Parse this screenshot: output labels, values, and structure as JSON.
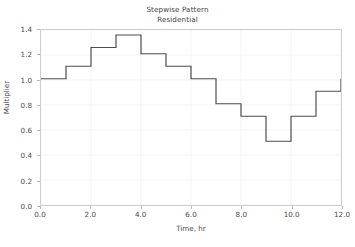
{
  "chart_data": {
    "type": "line",
    "subtype": "step-post",
    "title": "Stepwise Pattern",
    "subtitle": "Residential",
    "xlabel": "Time, hr",
    "ylabel": "Multiplier",
    "xlim": [
      0.0,
      12.0
    ],
    "ylim": [
      0.0,
      1.4
    ],
    "xticks": [
      "0.0",
      "2.0",
      "4.0",
      "6.0",
      "8.0",
      "10.0",
      "12.0"
    ],
    "xtick_values": [
      0.0,
      2.0,
      4.0,
      6.0,
      8.0,
      10.0,
      12.0
    ],
    "yticks": [
      "0.0",
      "0.2",
      "0.4",
      "0.6",
      "0.8",
      "1.0",
      "1.2",
      "1.4"
    ],
    "ytick_values": [
      0.0,
      0.2,
      0.4,
      0.6,
      0.8,
      1.0,
      1.2,
      1.4
    ],
    "grid": true,
    "legend": false,
    "line_color": "#4d4d4d",
    "x": [
      0,
      1,
      2,
      3,
      4,
      5,
      6,
      7,
      8,
      9,
      10,
      11,
      12
    ],
    "values": [
      1.01,
      1.11,
      1.26,
      1.36,
      1.21,
      1.11,
      1.01,
      0.81,
      0.71,
      0.51,
      0.71,
      0.91,
      1.01
    ],
    "steps": [
      {
        "x_start": 0,
        "x_end": 1,
        "value": 1.01
      },
      {
        "x_start": 1,
        "x_end": 2,
        "value": 1.11
      },
      {
        "x_start": 2,
        "x_end": 3,
        "value": 1.26
      },
      {
        "x_start": 3,
        "x_end": 4,
        "value": 1.36
      },
      {
        "x_start": 4,
        "x_end": 5,
        "value": 1.21
      },
      {
        "x_start": 5,
        "x_end": 6,
        "value": 1.11
      },
      {
        "x_start": 6,
        "x_end": 7,
        "value": 1.01
      },
      {
        "x_start": 7,
        "x_end": 8,
        "value": 0.81
      },
      {
        "x_start": 8,
        "x_end": 9,
        "value": 0.71
      },
      {
        "x_start": 9,
        "x_end": 10,
        "value": 0.51
      },
      {
        "x_start": 10,
        "x_end": 11,
        "value": 0.71
      },
      {
        "x_start": 11,
        "x_end": 12,
        "value": 0.91
      }
    ],
    "final_riser_value": 1.01
  }
}
